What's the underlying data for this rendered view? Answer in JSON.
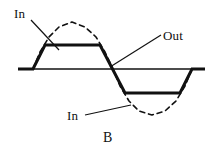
{
  "figure": {
    "panel_label": "B",
    "labels": {
      "in_top": "In",
      "out": "Out",
      "in_bottom": "In"
    },
    "colors": {
      "stroke": "#111111",
      "axis": "#111111",
      "dashed": "#111111",
      "background": "#ffffff"
    }
  },
  "chart_data": {
    "type": "line",
    "title": "B",
    "xlabel": "",
    "ylabel": "",
    "grid": false,
    "legend": "inline-annotations",
    "xlim": [
      0,
      220
    ],
    "ylim": [
      156,
      0
    ],
    "axis_line": {
      "y": 69,
      "x_start": 18,
      "x_end": 205
    },
    "annotations": [
      {
        "text": "In",
        "x": 14,
        "y": 7,
        "points_to": [
          57,
          48
        ]
      },
      {
        "text": "Out",
        "x": 163,
        "y": 29,
        "points_to": [
          111,
          66
        ]
      },
      {
        "text": "In",
        "x": 67,
        "y": 109,
        "points_to": [
          130,
          104
        ]
      },
      {
        "text": "B",
        "x": 103,
        "y": 131,
        "points_to": null
      }
    ],
    "series": [
      {
        "name": "Out",
        "style": "solid-thick",
        "linewidth": 3,
        "points": [
          [
            18,
            69
          ],
          [
            33,
            69
          ],
          [
            45,
            45
          ],
          [
            100,
            45
          ],
          [
            125,
            93
          ],
          [
            180,
            93
          ],
          [
            192,
            69
          ],
          [
            205,
            69
          ]
        ]
      },
      {
        "name": "In",
        "style": "dashed",
        "linewidth": 1.6,
        "dasharray": "5,4",
        "points": [
          [
            33,
            69
          ],
          [
            40,
            52
          ],
          [
            49,
            37
          ],
          [
            59,
            27
          ],
          [
            72,
            22
          ],
          [
            85,
            27
          ],
          [
            96,
            37
          ],
          [
            105,
            52
          ],
          [
            113,
            69
          ],
          [
            120,
            86
          ],
          [
            129,
            101
          ],
          [
            139,
            111
          ],
          [
            152,
            115
          ],
          [
            165,
            111
          ],
          [
            176,
            101
          ],
          [
            185,
            86
          ],
          [
            192,
            69
          ]
        ]
      }
    ],
    "leader_lines": [
      {
        "name": "in-top-leader",
        "from": [
          31,
          20
        ],
        "to": [
          59,
          50
        ]
      },
      {
        "name": "out-leader",
        "from": [
          161,
          35
        ],
        "to": [
          110,
          67
        ]
      },
      {
        "name": "in-bottom-leader",
        "from": [
          85,
          115
        ],
        "to": [
          131,
          105
        ]
      }
    ]
  }
}
